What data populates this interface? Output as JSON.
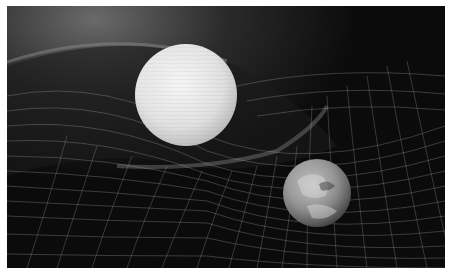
{
  "image": {
    "description": "Illustration of spacetime curvature grid with two planets",
    "colors": {
      "background": "#0b0b0b",
      "grid": "#bdbdbd",
      "large_planet": "#e6e6e6",
      "small_planet": "#8c8c8c"
    },
    "objects": [
      {
        "name": "large-planet",
        "cx": 179,
        "cy": 89,
        "r": 51
      },
      {
        "name": "small-planet",
        "cx": 310,
        "cy": 187,
        "r": 34
      }
    ]
  }
}
